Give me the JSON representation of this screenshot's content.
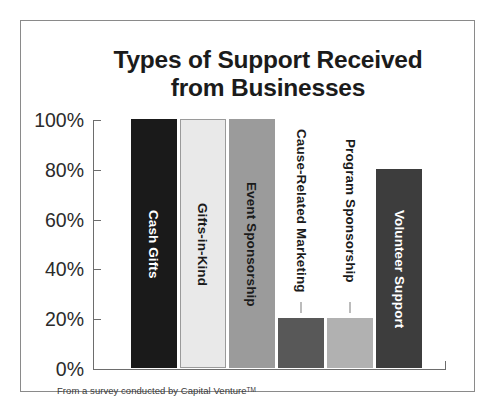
{
  "chart_data": {
    "type": "bar",
    "title": "Types of Support Received from Businesses",
    "title_lines": [
      "Types of Support Received",
      "from Businesses"
    ],
    "xlabel": "",
    "ylabel": "",
    "ylim": [
      0,
      100
    ],
    "ytick_labels": [
      "100%",
      "80%",
      "60%",
      "40%",
      "20%",
      "0%"
    ],
    "ytick_values": [
      100,
      80,
      60,
      40,
      20,
      0
    ],
    "grid": false,
    "legend": "none",
    "value_suffix": "%",
    "categories": [
      "Cash Gifts",
      "Gifts-in-Kind",
      "Event Sponsorship",
      "Cause-Related Marketing",
      "Program Sponsorship",
      "Volunteer Support"
    ],
    "values": [
      100,
      100,
      100,
      20,
      20,
      80
    ],
    "bars": [
      {
        "label": "Cash Gifts",
        "value": 100,
        "color": "#1a1a1a",
        "border_color": "#1a1a1a",
        "label_color": "#ffffff",
        "label_placement": "inside",
        "leader": false
      },
      {
        "label": "Gifts-in-Kind",
        "value": 100,
        "color": "#e9e9e9",
        "border_color": "#9a9a9a",
        "label_color": "#1b1b1b",
        "label_placement": "inside",
        "leader": false
      },
      {
        "label": "Event Sponsorship",
        "value": 100,
        "color": "#9b9b9b",
        "border_color": "#9b9b9b",
        "label_color": "#1b1b1b",
        "label_placement": "inside",
        "leader": false
      },
      {
        "label": "Cause-Related Marketing",
        "value": 20,
        "color": "#585858",
        "border_color": "#585858",
        "label_color": "#1b1b1b",
        "label_placement": "outside",
        "leader": true
      },
      {
        "label": "Program Sponsorship",
        "value": 20,
        "color": "#b1b1b1",
        "border_color": "#b1b1b1",
        "label_color": "#1b1b1b",
        "label_placement": "outside",
        "leader": true
      },
      {
        "label": "Volunteer Support",
        "value": 80,
        "color": "#3d3d3d",
        "border_color": "#3d3d3d",
        "label_color": "#ffffff",
        "label_placement": "inside",
        "leader": false
      }
    ]
  },
  "footnote": {
    "text": "From a survey conducted by Capital Venture",
    "trademark": "TM"
  },
  "colors": {
    "axis": "#6d6d6d",
    "frame": "#8a8a8a",
    "text": "#1b1b1b",
    "background": "#ffffff"
  }
}
